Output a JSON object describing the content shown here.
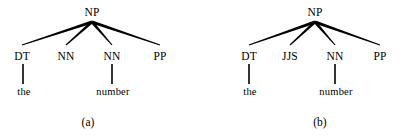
{
  "figure": {
    "background_color": "#ffffff",
    "ink_color": "#000000",
    "trees": [
      {
        "id": "tree-a",
        "caption": "(a)",
        "caption_x": 88,
        "caption_y": 116,
        "root": {
          "label": "NP",
          "x": 92,
          "y": 6,
          "apex_x": 92,
          "apex_y": 22
        },
        "children": [
          {
            "label": "DT",
            "x": 22,
            "y": 50,
            "branch_end_x": 22,
            "branch_end_y": 45,
            "word": "the",
            "word_x": 24,
            "word_y": 86,
            "stem_top_y": 64,
            "stem_bottom_y": 84,
            "stem_x": 23
          },
          {
            "label": "NN",
            "x": 66,
            "y": 50,
            "branch_end_x": 66,
            "branch_end_y": 45,
            "word": null
          },
          {
            "label": "NN",
            "x": 112,
            "y": 50,
            "branch_end_x": 112,
            "branch_end_y": 45,
            "word": "number",
            "word_x": 113,
            "word_y": 86,
            "stem_top_y": 64,
            "stem_bottom_y": 84,
            "stem_x": 112
          },
          {
            "label": "PP",
            "x": 160,
            "y": 50,
            "branch_end_x": 160,
            "branch_end_y": 45,
            "word": null
          }
        ]
      },
      {
        "id": "tree-b",
        "caption": "(b)",
        "caption_x": 320,
        "caption_y": 116,
        "root": {
          "label": "NP",
          "x": 114,
          "y": 6,
          "apex_x": 114,
          "apex_y": 22
        },
        "children": [
          {
            "label": "DT",
            "x": 48,
            "y": 50,
            "branch_end_x": 48,
            "branch_end_y": 45,
            "word": "the",
            "word_x": 49,
            "word_y": 86,
            "stem_top_y": 64,
            "stem_bottom_y": 84,
            "stem_x": 48
          },
          {
            "label": "JJS",
            "x": 89,
            "y": 50,
            "branch_end_x": 89,
            "branch_end_y": 45,
            "word": null
          },
          {
            "label": "NN",
            "x": 134,
            "y": 50,
            "branch_end_x": 134,
            "branch_end_y": 45,
            "word": "number",
            "word_x": 135,
            "word_y": 86,
            "stem_top_y": 64,
            "stem_bottom_y": 84,
            "stem_x": 134
          },
          {
            "label": "PP",
            "x": 179,
            "y": 50,
            "branch_end_x": 179,
            "branch_end_y": 45,
            "word": null
          }
        ]
      }
    ]
  }
}
